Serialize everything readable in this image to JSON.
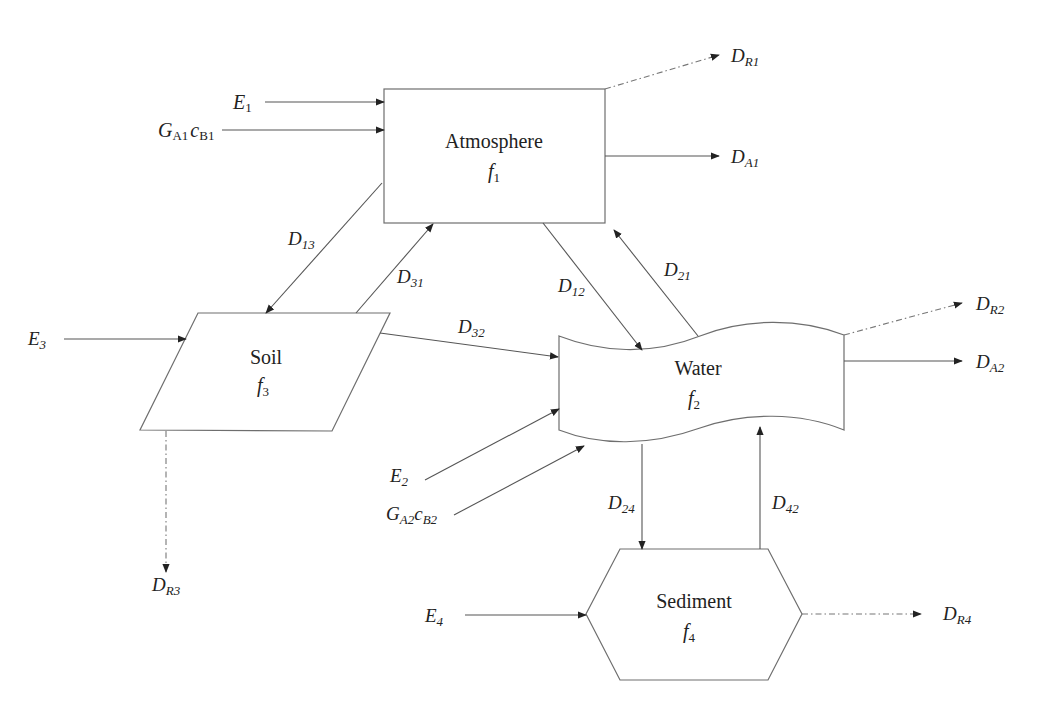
{
  "compartments": {
    "atmosphere": {
      "name": "Atmosphere",
      "fug": "f",
      "fug_sub": "1"
    },
    "water": {
      "name": "Water",
      "fug": "f",
      "fug_sub": "2"
    },
    "soil": {
      "name": "Soil",
      "fug": "f",
      "fug_sub": "3"
    },
    "sediment": {
      "name": "Sediment",
      "fug": "f",
      "fug_sub": "4"
    }
  },
  "inputs": {
    "E1": {
      "main": "E",
      "sub": "1"
    },
    "GA1cB1": {
      "main1": "G",
      "sub1": "A1",
      "main2": "c",
      "sub2": "B1"
    },
    "E2": {
      "main": "E",
      "sub": "2"
    },
    "GA2cB2": {
      "main1": "G",
      "sub1": "A2",
      "main2": "c",
      "sub2": "B2"
    },
    "E3": {
      "main": "E",
      "sub": "3"
    },
    "E4": {
      "main": "E",
      "sub": "4"
    }
  },
  "outputs": {
    "DR1": {
      "main": "D",
      "sub": "R1"
    },
    "DA1": {
      "main": "D",
      "sub": "A1"
    },
    "DR2": {
      "main": "D",
      "sub": "R2"
    },
    "DA2": {
      "main": "D",
      "sub": "A2"
    },
    "DR3": {
      "main": "D",
      "sub": "R3"
    },
    "DR4": {
      "main": "D",
      "sub": "R4"
    }
  },
  "transfers": {
    "D13": {
      "main": "D",
      "sub": "13"
    },
    "D31": {
      "main": "D",
      "sub": "31"
    },
    "D12": {
      "main": "D",
      "sub": "12"
    },
    "D21": {
      "main": "D",
      "sub": "21"
    },
    "D32": {
      "main": "D",
      "sub": "32"
    },
    "D24": {
      "main": "D",
      "sub": "24"
    },
    "D42": {
      "main": "D",
      "sub": "42"
    }
  },
  "colors": {
    "stroke": "#6e6e6e",
    "text": "#222222",
    "background": "#ffffff"
  }
}
